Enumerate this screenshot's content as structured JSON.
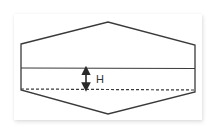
{
  "diagram": {
    "type": "tank-cross-section",
    "shape": "hexagon",
    "stroke_color": "#3a3a3a",
    "background": "#ffffff",
    "label": "H",
    "elements": {
      "outline": "hexagonal vessel outline",
      "solid_line": "upper horizontal reference line",
      "dashed_line": "lower horizontal reference line",
      "dimension_arrow": "double-headed vertical arrow indicating height H between solid and dashed lines"
    }
  }
}
